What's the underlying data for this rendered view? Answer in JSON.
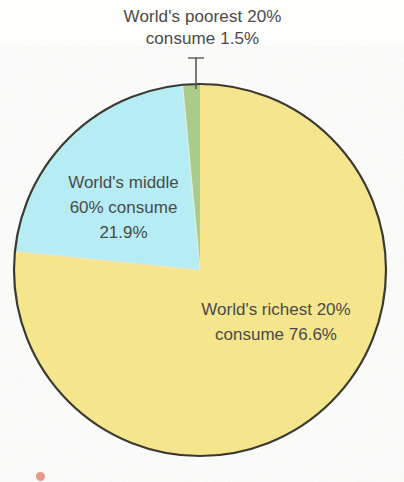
{
  "chart_data": {
    "type": "pie",
    "title": "",
    "subtitle": "",
    "xlabel": "",
    "ylabel": "",
    "legend_position": "none",
    "grid": false,
    "labels": [
      "World's poorest 20%",
      "World's middle 60%",
      "World's richest 20%"
    ],
    "values": [
      1.5,
      21.9,
      76.6
    ],
    "value_unit": "%",
    "colors": [
      "#a9cc8b",
      "#b6ecf4",
      "#f5e58c"
    ],
    "annotations": [
      {
        "name": "poorest",
        "text": "World's poorest 20%\nconsume 1.5%",
        "line1": "World's poorest 20%",
        "line2": "consume 1.5%",
        "value": 1.5,
        "placement": "outside-top-with-leader"
      },
      {
        "name": "middle",
        "text": "World's middle\n60% consume\n21.9%",
        "line1": "World's middle",
        "line2": "60% consume",
        "line3": "21.9%",
        "value": 21.9,
        "placement": "inside-left"
      },
      {
        "name": "richest",
        "text": "World's richest 20%\nconsume 76.6%",
        "line1": "World's richest 20%",
        "line2": "consume 76.6%",
        "value": 76.6,
        "placement": "inside-right"
      }
    ]
  },
  "figure": {
    "background_color": "#fdfdfc",
    "text_color": "#4a4a4a",
    "outline_color": "#3a3a32",
    "center_x": 200,
    "center_y": 270,
    "radius": 186,
    "start_angle_deg": 90,
    "direction": "clockwise"
  },
  "callouts": {
    "poorest": "World's poorest 20%\nconsume 1.5%",
    "middle": "World's middle\n60% consume\n21.9%",
    "richest": "World's richest 20%\nconsume 76.6%"
  },
  "slices": {
    "poorest_color": "#a9cc8b",
    "middle_color": "#b6ecf4",
    "richest_color": "#f5e58c"
  }
}
